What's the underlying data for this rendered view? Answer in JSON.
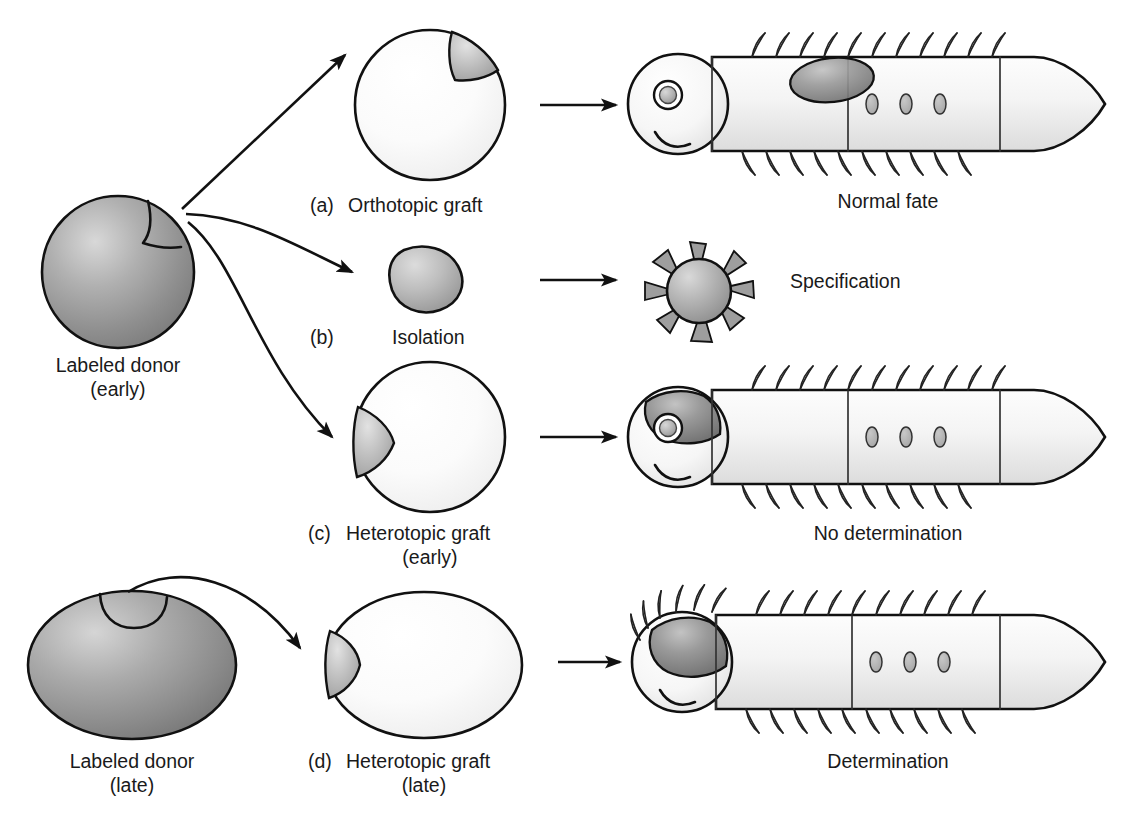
{
  "figure": {
    "background_color": "#ffffff",
    "line_color": "#111111"
  },
  "palette": {
    "donor_gray_light": "#c9c9c9",
    "donor_gray_mid": "#9a9a9a",
    "donor_gray_dark": "#6e6e6e",
    "graft_gray_light": "#d6d6d6",
    "graft_gray_mid": "#a8a8a8",
    "graft_gray_dark": "#7a7a7a",
    "host_fill_light": "#fdfdfd",
    "host_fill_shade": "#e6e6e6",
    "larva_fill_light": "#fafafa",
    "larva_fill_shade": "#dcdcdc",
    "spot_fill": "#b5b5b5",
    "outline": "#111111"
  },
  "labels": {
    "donor_early_line1": "Labeled donor",
    "donor_early_line2": "(early)",
    "donor_late_line1": "Labeled donor",
    "donor_late_line2": "(late)",
    "a_tag": "(a)",
    "a_name": "Orthotopic graft",
    "b_tag": "(b)",
    "b_name": "Isolation",
    "c_tag": "(c)",
    "c_name": "Heterotopic graft",
    "c_sub": "(early)",
    "d_tag": "(d)",
    "d_name": "Heterotopic graft",
    "d_sub": "(late)"
  },
  "outcomes": {
    "row_a": "Normal fate",
    "row_b": "Specification",
    "row_c": "No determination",
    "row_d": "Determination"
  },
  "rows": [
    {
      "id": "row-a",
      "procedure_tag": "(a)",
      "procedure": "Orthotopic graft",
      "result": "Normal fate",
      "host_shape": "circle",
      "graft_position": "dorsal-trunk",
      "result_shape": "larva-with-dorsal-graft",
      "larva_has_eye": true,
      "larva_trunk_spots": 3
    },
    {
      "id": "row-b",
      "procedure_tag": "(b)",
      "procedure": "Isolation",
      "result": "Specification",
      "host_shape": "isolated-blastomere",
      "graft_position": "none",
      "result_shape": "ciliated-ball",
      "ciliated_ball_spines": 12
    },
    {
      "id": "row-c",
      "procedure_tag": "(c)",
      "procedure": "Heterotopic graft",
      "procedure_sub": "(early)",
      "result": "No determination",
      "host_shape": "circle",
      "graft_position": "anterior-head",
      "result_shape": "larva-with-head-graft",
      "larva_has_eye": true,
      "larva_trunk_spots": 3
    },
    {
      "id": "row-d",
      "procedure_tag": "(d)",
      "procedure": "Heterotopic graft",
      "procedure_sub": "(late)",
      "result": "Determination",
      "host_shape": "ellipse",
      "graft_position": "anterior-head",
      "result_shape": "larva-with-ectopic-setae-head",
      "larva_has_eye": false,
      "larva_trunk_spots": 3
    }
  ],
  "donors": [
    {
      "id": "donor-early",
      "shape": "sphere",
      "label_line1": "Labeled donor",
      "label_line2": "(early)",
      "marked_region": "upper-right-wedge"
    },
    {
      "id": "donor-late",
      "shape": "ellipse",
      "label_line1": "Labeled donor",
      "label_line2": "(late)",
      "marked_region": "top-notch"
    }
  ],
  "arrows": {
    "donor_to_a": "straight-diagonal-up-right",
    "donor_to_b": "curved-down-right",
    "donor_to_c": "curved-long-down-right",
    "donor_late_to_d": "curved-over-down-right",
    "a_to_result": "straight-right",
    "b_to_result": "straight-right",
    "c_to_result": "straight-right",
    "d_to_result": "straight-right"
  }
}
